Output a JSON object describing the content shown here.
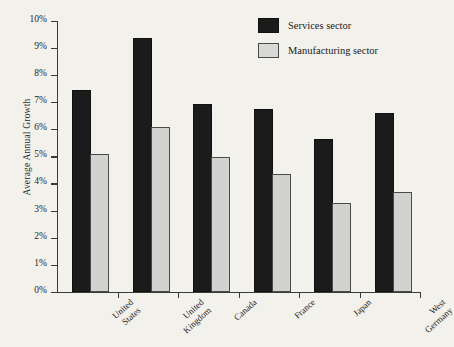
{
  "chart_data": {
    "type": "bar",
    "title": "",
    "xlabel": "",
    "ylabel": "Average Annual Growth",
    "ylim": [
      0,
      10
    ],
    "ytick_labels": [
      "0%",
      "1%",
      "2%",
      "3%",
      "4%",
      "5%",
      "6%",
      "7%",
      "8%",
      "9%",
      "10%"
    ],
    "ytick_values": [
      0,
      1,
      2,
      3,
      4,
      5,
      6,
      7,
      8,
      9,
      10
    ],
    "grid": false,
    "legend_position": "top-right",
    "categories": [
      "United States",
      "United Kingdom",
      "Canada",
      "France",
      "Japan",
      "West Germany"
    ],
    "category_lines": [
      [
        "United",
        "States"
      ],
      [
        "United",
        "Kingdom"
      ],
      [
        "Canada"
      ],
      [
        "France"
      ],
      [
        "Japan"
      ],
      [
        "West",
        "Germany"
      ]
    ],
    "series": [
      {
        "name": "Services sector",
        "color": "#1b1b1b",
        "values": [
          7.35,
          9.3,
          6.85,
          6.65,
          5.55,
          6.5
        ]
      },
      {
        "name": "Manufacturing sector",
        "color": "#d2d2d0",
        "values": [
          5.0,
          6.0,
          4.9,
          4.25,
          3.2,
          3.6
        ]
      }
    ]
  },
  "legend": {
    "items": [
      {
        "label": "Services sector",
        "swatch": "services"
      },
      {
        "label": "Manufacturing sector",
        "swatch": "manufacturing"
      }
    ]
  },
  "colors": {
    "background": "#f3f1ec",
    "axis": "#3a3a3a",
    "services": "#1b1b1b",
    "manufacturing": "#d2d2d0"
  }
}
